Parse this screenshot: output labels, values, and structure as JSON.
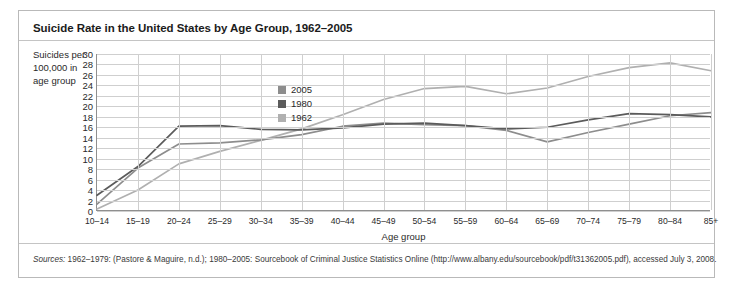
{
  "figure": {
    "title": "Suicide Rate in the United States by Age Group, 1962–2005",
    "sources_label": "Sources:",
    "sources_text": " 1962–1979: (Pastore & Maguire, n.d.); 1980–2005: Sourcebook of Criminal Justice Statistics Online (http://www.albany.edu/sourcebook/pdf/t31362005.pdf), accessed July 3, 2008."
  },
  "chart_data": {
    "type": "line",
    "title": "Suicide Rate in the United States by Age Group, 1962–2005",
    "xlabel": "Age group",
    "ylabel": "Suicides per 100,000 in age group",
    "ylim": [
      0,
      30
    ],
    "ytick_step": 2,
    "yticks": [
      30,
      28,
      26,
      24,
      22,
      20,
      18,
      16,
      14,
      12,
      10,
      8,
      6,
      4,
      2,
      0
    ],
    "grid": true,
    "legend_position": "inside-upper-left",
    "categories": [
      "10–14",
      "15–19",
      "20–24",
      "25–29",
      "30–34",
      "35–39",
      "40–44",
      "45–49",
      "50–54",
      "55–59",
      "60–64",
      "65–69",
      "70–74",
      "75–79",
      "80–84",
      "85+"
    ],
    "series": [
      {
        "name": "2005",
        "color": "#8d8d8d",
        "values": [
          1.3,
          8.2,
          12.8,
          13.0,
          13.6,
          14.6,
          16.2,
          16.8,
          16.5,
          16.3,
          15.4,
          13.2,
          15.0,
          16.6,
          18.2,
          18.8
        ]
      },
      {
        "name": "1980",
        "color": "#5b5b5b",
        "values": [
          3.0,
          8.5,
          16.2,
          16.3,
          15.6,
          15.5,
          15.9,
          16.6,
          16.8,
          16.3,
          15.7,
          16.0,
          17.4,
          18.6,
          18.4,
          18.0
        ]
      },
      {
        "name": "1962",
        "color": "#b0b0b0",
        "values": [
          0.4,
          4.0,
          9.0,
          11.4,
          13.5,
          15.7,
          18.4,
          21.3,
          23.4,
          23.8,
          22.4,
          23.5,
          25.7,
          27.4,
          28.3,
          26.8
        ]
      }
    ]
  }
}
